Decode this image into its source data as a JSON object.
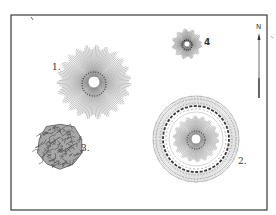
{
  "figure": {
    "frame": {
      "x": 11,
      "y": 15,
      "width": 256,
      "height": 195,
      "stroke": "#3a3a3a"
    },
    "ink_color": "#555555",
    "features": [
      {
        "id": 1,
        "label": "1.",
        "type": "radiating-mound",
        "cx": 94,
        "cy": 82,
        "r": 35,
        "label_x": 52,
        "label_y": 65
      },
      {
        "id": 2,
        "label": "2.",
        "type": "ringed-mound",
        "cx": 196,
        "cy": 139,
        "r": 43,
        "inner_r": 22,
        "label_x": 239,
        "label_y": 159
      },
      {
        "id": 3,
        "label": "3.",
        "type": "stone-cairn",
        "cx": 60,
        "cy": 146,
        "r": 24,
        "label_x": 82,
        "label_y": 146
      },
      {
        "id": 4,
        "label": "4",
        "type": "small-radiating-mound",
        "cx": 187,
        "cy": 44,
        "r": 14,
        "label_x": 204,
        "label_y": 39
      }
    ],
    "north_arrow": {
      "label": "N",
      "x": 259,
      "y1": 33,
      "y2": 98
    }
  }
}
